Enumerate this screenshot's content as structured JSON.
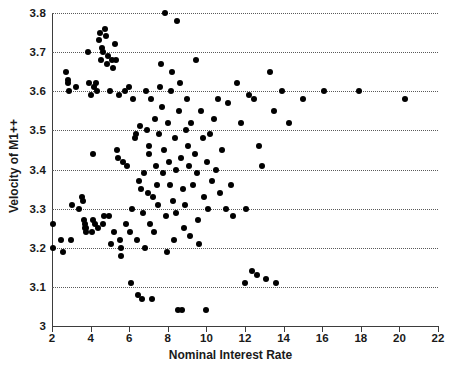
{
  "chart_data": {
    "type": "scatter",
    "title": "",
    "xlabel": "Nominal Interest Rate",
    "ylabel": "Velocity of M1++",
    "xlim": [
      2,
      22
    ],
    "ylim": [
      3.0,
      3.8
    ],
    "xticks": [
      2,
      4,
      6,
      8,
      10,
      12,
      14,
      16,
      18,
      20,
      22
    ],
    "xticklabels": [
      "2",
      "4",
      "6",
      "8",
      "10",
      "12",
      "14",
      "16",
      "18",
      "20",
      "22"
    ],
    "yticks": [
      3.0,
      3.1,
      3.2,
      3.3,
      3.4,
      3.5,
      3.6,
      3.7,
      3.8
    ],
    "yticklabels": [
      "3",
      "3.1",
      "3.2",
      "3.3",
      "3.4",
      "3.5",
      "3.6",
      "3.7",
      "3.8"
    ],
    "grid": "horizontal-dotted",
    "legend": "none",
    "marker": {
      "shape": "circle",
      "color": "#000000",
      "size": 6
    },
    "n_points": 168,
    "points": [
      [
        2.05,
        3.26
      ],
      [
        2.05,
        3.2
      ],
      [
        2.45,
        3.22
      ],
      [
        2.55,
        3.19
      ],
      [
        2.7,
        3.65
      ],
      [
        2.85,
        3.63
      ],
      [
        2.85,
        3.62
      ],
      [
        2.88,
        3.6
      ],
      [
        3.0,
        3.22
      ],
      [
        3.05,
        3.31
      ],
      [
        3.25,
        3.61
      ],
      [
        3.4,
        3.3
      ],
      [
        3.55,
        3.33
      ],
      [
        3.6,
        3.32
      ],
      [
        3.65,
        3.27
      ],
      [
        3.7,
        3.25
      ],
      [
        3.72,
        3.26
      ],
      [
        3.75,
        3.24
      ],
      [
        3.78,
        3.25
      ],
      [
        3.85,
        3.7
      ],
      [
        3.9,
        3.62
      ],
      [
        4.0,
        3.59
      ],
      [
        4.05,
        3.24
      ],
      [
        4.1,
        3.44
      ],
      [
        4.15,
        3.27
      ],
      [
        4.2,
        3.61
      ],
      [
        4.25,
        3.26
      ],
      [
        4.3,
        3.62
      ],
      [
        4.35,
        3.6
      ],
      [
        4.4,
        3.25
      ],
      [
        4.45,
        3.73
      ],
      [
        4.5,
        3.75
      ],
      [
        4.55,
        3.68
      ],
      [
        4.6,
        3.71
      ],
      [
        4.62,
        3.7
      ],
      [
        4.65,
        3.26
      ],
      [
        4.7,
        3.28
      ],
      [
        4.75,
        3.76
      ],
      [
        4.8,
        3.74
      ],
      [
        4.85,
        3.67
      ],
      [
        4.9,
        3.69
      ],
      [
        4.95,
        3.28
      ],
      [
        5.0,
        3.6
      ],
      [
        5.05,
        3.21
      ],
      [
        5.1,
        3.68
      ],
      [
        5.15,
        3.66
      ],
      [
        5.2,
        3.24
      ],
      [
        5.25,
        3.72
      ],
      [
        5.3,
        3.68
      ],
      [
        5.35,
        3.45
      ],
      [
        5.4,
        3.43
      ],
      [
        5.45,
        3.59
      ],
      [
        5.5,
        3.22
      ],
      [
        5.55,
        3.18
      ],
      [
        5.6,
        3.2
      ],
      [
        5.7,
        3.42
      ],
      [
        5.8,
        3.6
      ],
      [
        5.85,
        3.26
      ],
      [
        5.9,
        3.41
      ],
      [
        6.0,
        3.61
      ],
      [
        6.05,
        3.24
      ],
      [
        6.1,
        3.11
      ],
      [
        6.15,
        3.3
      ],
      [
        6.2,
        3.58
      ],
      [
        6.3,
        3.48
      ],
      [
        6.35,
        3.49
      ],
      [
        6.4,
        3.22
      ],
      [
        6.45,
        3.08
      ],
      [
        6.5,
        3.37
      ],
      [
        6.55,
        3.51
      ],
      [
        6.6,
        3.35
      ],
      [
        6.65,
        3.07
      ],
      [
        6.7,
        3.29
      ],
      [
        6.75,
        3.39
      ],
      [
        6.8,
        3.2
      ],
      [
        6.85,
        3.6
      ],
      [
        6.9,
        3.5
      ],
      [
        6.95,
        3.34
      ],
      [
        7.0,
        3.46
      ],
      [
        7.05,
        3.44
      ],
      [
        7.1,
        3.26
      ],
      [
        7.15,
        3.58
      ],
      [
        7.2,
        3.07
      ],
      [
        7.25,
        3.33
      ],
      [
        7.3,
        3.24
      ],
      [
        7.35,
        3.53
      ],
      [
        7.4,
        3.41
      ],
      [
        7.45,
        3.36
      ],
      [
        7.5,
        3.31
      ],
      [
        7.55,
        3.49
      ],
      [
        7.6,
        3.61
      ],
      [
        7.65,
        3.67
      ],
      [
        7.7,
        3.56
      ],
      [
        7.75,
        3.39
      ],
      [
        7.8,
        3.45
      ],
      [
        7.85,
        3.8
      ],
      [
        7.9,
        3.28
      ],
      [
        7.95,
        3.19
      ],
      [
        8.0,
        3.52
      ],
      [
        8.05,
        3.42
      ],
      [
        8.1,
        3.36
      ],
      [
        8.15,
        3.6
      ],
      [
        8.2,
        3.65
      ],
      [
        8.25,
        3.32
      ],
      [
        8.3,
        3.22
      ],
      [
        8.35,
        3.48
      ],
      [
        8.4,
        3.4
      ],
      [
        8.45,
        3.29
      ],
      [
        8.5,
        3.78
      ],
      [
        8.55,
        3.04
      ],
      [
        8.6,
        3.55
      ],
      [
        8.65,
        3.62
      ],
      [
        8.7,
        3.43
      ],
      [
        8.75,
        3.04
      ],
      [
        8.8,
        3.35
      ],
      [
        8.85,
        3.25
      ],
      [
        8.9,
        3.31
      ],
      [
        8.95,
        3.5
      ],
      [
        9.0,
        3.58
      ],
      [
        9.05,
        3.46
      ],
      [
        9.1,
        3.41
      ],
      [
        9.15,
        3.23
      ],
      [
        9.2,
        3.52
      ],
      [
        9.3,
        3.36
      ],
      [
        9.4,
        3.44
      ],
      [
        9.45,
        3.68
      ],
      [
        9.5,
        3.39
      ],
      [
        9.55,
        3.27
      ],
      [
        9.6,
        3.21
      ],
      [
        9.7,
        3.55
      ],
      [
        9.8,
        3.48
      ],
      [
        9.9,
        3.33
      ],
      [
        10.0,
        3.04
      ],
      [
        10.05,
        3.42
      ],
      [
        10.1,
        3.3
      ],
      [
        10.2,
        3.49
      ],
      [
        10.3,
        3.37
      ],
      [
        10.4,
        3.53
      ],
      [
        10.5,
        3.4
      ],
      [
        10.6,
        3.58
      ],
      [
        10.7,
        3.34
      ],
      [
        10.8,
        3.45
      ],
      [
        11.0,
        3.3
      ],
      [
        11.1,
        3.57
      ],
      [
        11.25,
        3.36
      ],
      [
        11.4,
        3.28
      ],
      [
        11.6,
        3.62
      ],
      [
        11.8,
        3.52
      ],
      [
        12.0,
        3.11
      ],
      [
        12.05,
        3.3
      ],
      [
        12.2,
        3.59
      ],
      [
        12.35,
        3.14
      ],
      [
        12.45,
        3.58
      ],
      [
        12.6,
        3.13
      ],
      [
        12.7,
        3.46
      ],
      [
        12.9,
        3.41
      ],
      [
        13.1,
        3.12
      ],
      [
        13.3,
        3.65
      ],
      [
        13.5,
        3.55
      ],
      [
        13.6,
        3.11
      ],
      [
        13.9,
        3.6
      ],
      [
        14.3,
        3.52
      ],
      [
        15.0,
        3.58
      ],
      [
        16.1,
        3.6
      ],
      [
        17.9,
        3.6
      ],
      [
        20.3,
        3.58
      ]
    ]
  }
}
